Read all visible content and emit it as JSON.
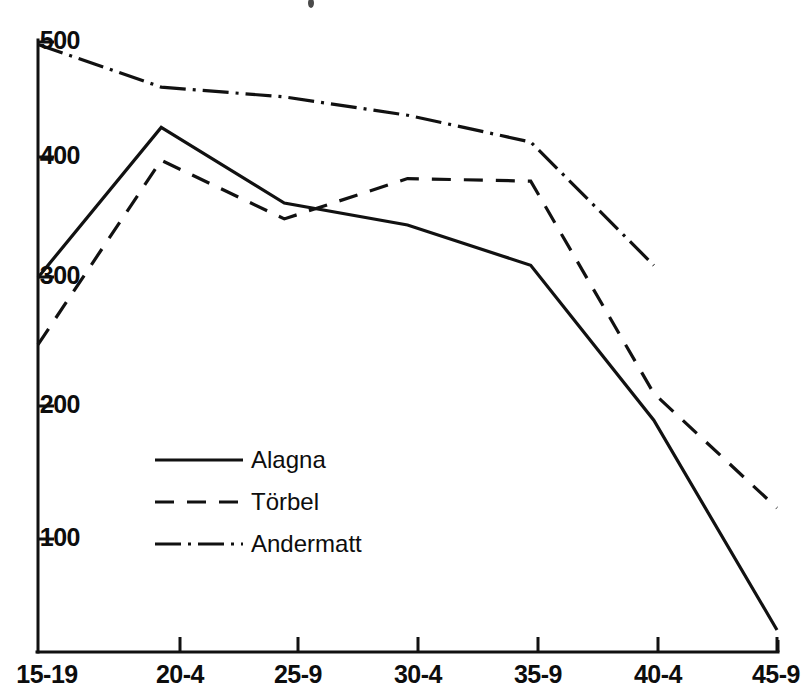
{
  "chart_data": {
    "type": "line",
    "title": "",
    "xlabel": "",
    "ylabel": "",
    "categories": [
      "15-19",
      "20-4",
      "25-9",
      "30-4",
      "35-9",
      "40-4",
      "45-9"
    ],
    "ylim": [
      0,
      510
    ],
    "xlim": [
      0,
      6
    ],
    "grid": false,
    "legend_position": "center-left",
    "y_ticks": [
      100,
      200,
      300,
      400,
      500
    ],
    "y_tick_labels": [
      "100",
      "200",
      "300",
      "400",
      "500"
    ],
    "series": [
      {
        "name": "Alagna",
        "style": "solid",
        "values": [
          307,
          430,
          368,
          350,
          317,
          190,
          18
        ]
      },
      {
        "name": "Törbel",
        "style": "dashed",
        "values": [
          252,
          403,
          355,
          388,
          386,
          212,
          118
        ]
      },
      {
        "name": "Andermatt",
        "style": "dash-dot",
        "values": [
          498,
          463,
          455,
          440,
          418,
          317,
          null
        ]
      }
    ]
  },
  "axes": {
    "y_tick_labels": [
      "500",
      "400",
      "300",
      "200",
      "100"
    ],
    "x_tick_labels": [
      "15-19",
      "20-4",
      "25-9",
      "30-4",
      "35-9",
      "40-4",
      "45-9"
    ]
  },
  "legend": {
    "entries": [
      {
        "label": "Alagna",
        "style": "solid"
      },
      {
        "label": "Törbel",
        "style": "dashed"
      },
      {
        "label": "Andermatt",
        "style": "dash-dot"
      }
    ]
  },
  "colors": {
    "ink": "#111111",
    "background": "#ffffff"
  }
}
